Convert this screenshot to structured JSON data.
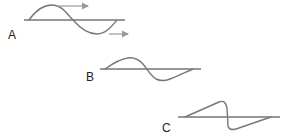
{
  "diagram": {
    "labels": {
      "a": "A",
      "b": "B",
      "c": "C"
    },
    "colors": {
      "baseline": "#333333",
      "wave": "#777777",
      "arrow": "#999999"
    },
    "panels": [
      {
        "id": "A",
        "shape": "sine-wave",
        "arrows": 2,
        "description": "symmetric sinusoidal pulse with two direction arrows pointing right"
      },
      {
        "id": "B",
        "shape": "skewed-wave",
        "arrows": 0,
        "description": "wave with steepened fronts"
      },
      {
        "id": "C",
        "shape": "sawtooth-shock",
        "arrows": 0,
        "description": "fully steepened wave with vertical shock front"
      }
    ]
  }
}
